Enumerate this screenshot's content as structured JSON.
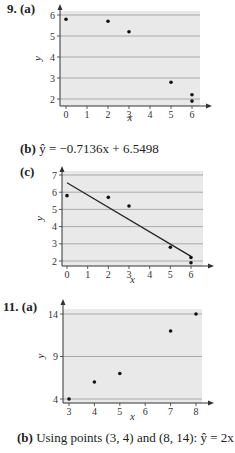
{
  "problems": [
    {
      "number": "9.",
      "parts": {
        "a": "(a)",
        "b_label": "(b)",
        "b_text": "ŷ = −0.7136x + 6.5498",
        "c": "(c)"
      }
    },
    {
      "number": "11.",
      "parts": {
        "a": "(a)",
        "b_label": "(b)",
        "b_text": "Using points (3, 4) and (8, 14): ŷ = 2x − 2"
      }
    }
  ],
  "chart_data": [
    {
      "id": "9a",
      "type": "scatter",
      "title": "",
      "xlabel": "x",
      "ylabel": "y",
      "x_ticks": [
        0,
        1,
        2,
        3,
        4,
        5,
        6
      ],
      "y_ticks": [
        2,
        3,
        4,
        5,
        6
      ],
      "xlim": [
        -0.3,
        6.4
      ],
      "ylim": [
        1.7,
        6.4
      ],
      "grid": "horizontal",
      "points": [
        [
          0,
          5.8
        ],
        [
          2,
          5.7
        ],
        [
          3,
          5.2
        ],
        [
          5,
          2.8
        ],
        [
          6,
          2.2
        ],
        [
          6,
          1.9
        ]
      ]
    },
    {
      "id": "9c",
      "type": "scatter",
      "title": "",
      "xlabel": "x",
      "ylabel": "y",
      "x_ticks": [
        0,
        1,
        2,
        3,
        4,
        5,
        6
      ],
      "y_ticks": [
        2,
        3,
        4,
        5,
        6,
        7
      ],
      "xlim": [
        -0.3,
        6.4
      ],
      "ylim": [
        1.7,
        7.3
      ],
      "grid": "horizontal",
      "points": [
        [
          0,
          5.8
        ],
        [
          2,
          5.7
        ],
        [
          3,
          5.2
        ],
        [
          5,
          2.8
        ],
        [
          6,
          2.2
        ],
        [
          6,
          1.9
        ]
      ],
      "regression_line": {
        "slope": -0.7136,
        "intercept": 6.5498,
        "x_range": [
          0,
          6
        ]
      }
    },
    {
      "id": "11a",
      "type": "scatter",
      "title": "",
      "xlabel": "x",
      "ylabel": "y",
      "x_ticks": [
        3,
        4,
        5,
        6,
        7,
        8
      ],
      "y_ticks": [
        4,
        9,
        14
      ],
      "xlim": [
        2.8,
        8.3
      ],
      "ylim": [
        3.5,
        15.5
      ],
      "grid": "horizontal",
      "points": [
        [
          3,
          4
        ],
        [
          4,
          6
        ],
        [
          5,
          7
        ],
        [
          7,
          12
        ],
        [
          8,
          14
        ]
      ]
    }
  ]
}
